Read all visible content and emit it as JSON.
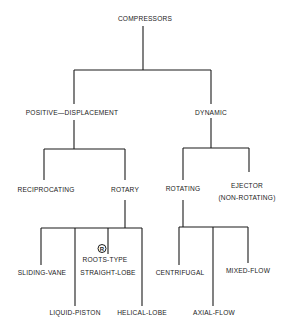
{
  "diagram": {
    "type": "tree",
    "root": {
      "label": "COMPRESSORS",
      "children": [
        {
          "label": "POSITIVE—DISPLACEMENT",
          "children": [
            {
              "label": "RECIPROCATING",
              "children": []
            },
            {
              "label": "ROTARY",
              "children": [
                {
                  "label": "SLIDING-VANE"
                },
                {
                  "label": "LIQUID-PISTON"
                },
                {
                  "label": "ROOTS-TYPE STRAIGHT-LOBE",
                  "mark": "R"
                },
                {
                  "label": "HELICAL-LOBE"
                }
              ]
            }
          ]
        },
        {
          "label": "DYNAMIC",
          "children": [
            {
              "label": "ROTATING",
              "children": [
                {
                  "label": "CENTRIFUGAL"
                },
                {
                  "label": "AXIAL-FLOW"
                },
                {
                  "label": "MIXED-FLOW"
                }
              ]
            },
            {
              "label": "EJECTOR (NON-ROTATING)",
              "children": []
            }
          ]
        }
      ]
    }
  },
  "labels": {
    "compressors": "COMPRESSORS",
    "positive_displacement": "POSITIVE—DISPLACEMENT",
    "dynamic": "DYNAMIC",
    "reciprocating": "RECIPROCATING",
    "rotary": "ROTARY",
    "rotating": "ROTATING",
    "ejector_line1": "EJECTOR",
    "ejector_line2": "(NON-ROTATING)",
    "sliding_vane": "SLIDING-VANE",
    "liquid_piston": "LIQUID-PISTON",
    "registered_mark": "R",
    "roots_type": "ROOTS-TYPE",
    "straight_lobe": "STRAIGHT-LOBE",
    "helical_lobe": "HELICAL-LOBE",
    "centrifugal": "CENTRIFUGAL",
    "axial_flow": "AXIAL-FLOW",
    "mixed_flow": "MIXED-FLOW"
  },
  "colors": {
    "line": "#1a1a1a",
    "background": "#ffffff"
  }
}
